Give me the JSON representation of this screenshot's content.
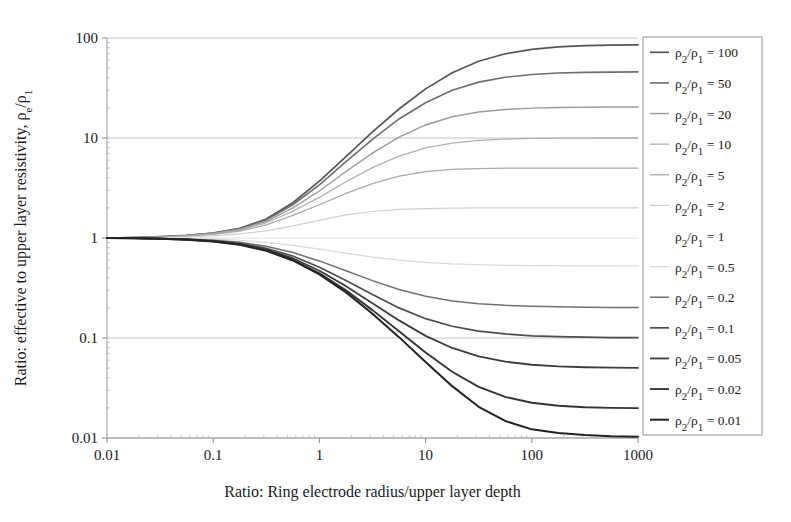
{
  "chart_data": {
    "type": "line",
    "title": "",
    "xlabel": "Ratio: Ring electrode radius/upper layer depth",
    "ylabel": "Ratio: effective to upper layer resistivity, ρe/ρ1",
    "xscale": "log",
    "yscale": "log",
    "xlim": [
      0.01,
      1000
    ],
    "ylim": [
      0.01,
      100
    ],
    "xticks": [
      "0.01",
      "0.1",
      "1",
      "10",
      "100",
      "1000"
    ],
    "xtick_values": [
      0.01,
      0.1,
      1,
      10,
      100,
      1000
    ],
    "yticks": [
      "0.01",
      "0.1",
      "1",
      "10",
      "100"
    ],
    "ytick_values": [
      0.01,
      0.1,
      1,
      10,
      100
    ],
    "grid": true,
    "grid_axis": "y",
    "legend_position": "right-outside",
    "legend_title": "",
    "x": [
      0.01,
      0.0178,
      0.0316,
      0.0562,
      0.1,
      0.178,
      0.316,
      0.562,
      1.0,
      1.78,
      3.16,
      5.62,
      10.0,
      17.8,
      31.6,
      56.2,
      100.0,
      178.0,
      316.0,
      562.0,
      1000.0
    ],
    "series": [
      {
        "name": "ρ2/ρ1 = 100",
        "k": 100,
        "color": "#565656",
        "width": 1.7,
        "values": [
          1.0,
          1.01,
          1.03,
          1.06,
          1.12,
          1.25,
          1.55,
          2.25,
          3.7,
          6.5,
          11.5,
          19.5,
          31.0,
          45.0,
          58.5,
          69.5,
          77.0,
          81.5,
          83.8,
          84.8,
          85.2
        ]
      },
      {
        "name": "ρ2/ρ1 = 50",
        "k": 50,
        "color": "#6e6e6e",
        "width": 1.6,
        "values": [
          1.0,
          1.01,
          1.03,
          1.06,
          1.12,
          1.24,
          1.52,
          2.15,
          3.4,
          5.8,
          9.7,
          15.5,
          22.5,
          30.0,
          36.2,
          40.5,
          43.2,
          44.6,
          45.3,
          45.6,
          45.8
        ]
      },
      {
        "name": "ρ2/ρ1 = 20",
        "k": 20,
        "color": "#9a9a9a",
        "width": 1.4,
        "values": [
          1.0,
          1.01,
          1.02,
          1.05,
          1.11,
          1.22,
          1.47,
          2.0,
          2.95,
          4.62,
          7.05,
          10.2,
          13.5,
          16.3,
          18.2,
          19.3,
          19.9,
          20.2,
          20.3,
          20.4,
          20.4
        ]
      },
      {
        "name": "ρ2/ρ1 = 10",
        "k": 10,
        "color": "#b0b0b0",
        "width": 1.3,
        "values": [
          1.0,
          1.01,
          1.02,
          1.05,
          1.1,
          1.2,
          1.42,
          1.85,
          2.55,
          3.65,
          5.05,
          6.6,
          7.95,
          8.9,
          9.45,
          9.75,
          9.9,
          9.96,
          9.98,
          10.0,
          10.0
        ]
      },
      {
        "name": "ρ2/ρ1 = 5",
        "k": 5,
        "color": "#a8a8a8",
        "width": 1.3,
        "values": [
          1.0,
          1.0,
          1.02,
          1.04,
          1.09,
          1.17,
          1.35,
          1.68,
          2.15,
          2.8,
          3.5,
          4.15,
          4.6,
          4.85,
          4.95,
          4.99,
          5.0,
          5.0,
          5.0,
          5.0,
          5.0
        ]
      },
      {
        "name": "ρ2/ρ1 = 2",
        "k": 2,
        "color": "#cfcfcf",
        "width": 1.2,
        "values": [
          1.0,
          1.0,
          1.01,
          1.02,
          1.05,
          1.1,
          1.18,
          1.32,
          1.5,
          1.7,
          1.84,
          1.93,
          1.97,
          1.99,
          2.0,
          2.0,
          2.0,
          2.0,
          2.0,
          2.0,
          2.0
        ]
      },
      {
        "name": "ρ2/ρ1 = 1",
        "k": 1,
        "color": "#ffffff",
        "width": 1.0,
        "values": [
          1.0,
          1.0,
          1.0,
          1.0,
          1.0,
          1.0,
          1.0,
          1.0,
          1.0,
          1.0,
          1.0,
          1.0,
          1.0,
          1.0,
          1.0,
          1.0,
          1.0,
          1.0,
          1.0,
          1.0,
          1.0
        ]
      },
      {
        "name": "ρ2/ρ1 = 0.5",
        "k": 0.5,
        "color": "#d8d8d8",
        "width": 1.2,
        "values": [
          1.0,
          1.0,
          0.995,
          0.99,
          0.975,
          0.95,
          0.905,
          0.845,
          0.775,
          0.705,
          0.645,
          0.6,
          0.57,
          0.55,
          0.54,
          0.533,
          0.53,
          0.528,
          0.527,
          0.526,
          0.525
        ]
      },
      {
        "name": "ρ2/ρ1 = 0.2",
        "k": 0.2,
        "color": "#707070",
        "width": 1.5,
        "values": [
          1.0,
          0.998,
          0.99,
          0.978,
          0.95,
          0.905,
          0.825,
          0.715,
          0.59,
          0.47,
          0.375,
          0.305,
          0.262,
          0.235,
          0.22,
          0.212,
          0.208,
          0.205,
          0.203,
          0.202,
          0.202
        ]
      },
      {
        "name": "ρ2/ρ1 = 0.1",
        "k": 0.1,
        "color": "#4d4d4d",
        "width": 1.7,
        "values": [
          1.0,
          0.997,
          0.988,
          0.972,
          0.94,
          0.885,
          0.79,
          0.66,
          0.51,
          0.375,
          0.272,
          0.2,
          0.156,
          0.131,
          0.117,
          0.11,
          0.105,
          0.103,
          0.102,
          0.101,
          0.101
        ]
      },
      {
        "name": "ρ2/ρ1 = 0.05",
        "k": 0.05,
        "color": "#3d3d3d",
        "width": 1.8,
        "values": [
          1.0,
          0.996,
          0.986,
          0.968,
          0.932,
          0.872,
          0.768,
          0.628,
          0.47,
          0.33,
          0.222,
          0.15,
          0.105,
          0.0795,
          0.0655,
          0.058,
          0.054,
          0.052,
          0.051,
          0.0505,
          0.0502
        ]
      },
      {
        "name": "ρ2/ρ1 = 0.02",
        "k": 0.02,
        "color": "#333333",
        "width": 1.9,
        "values": [
          1.0,
          0.995,
          0.984,
          0.965,
          0.926,
          0.862,
          0.752,
          0.606,
          0.444,
          0.3,
          0.19,
          0.117,
          0.0715,
          0.046,
          0.0325,
          0.0258,
          0.0225,
          0.021,
          0.0203,
          0.02,
          0.0199
        ]
      },
      {
        "name": "ρ2/ρ1 = 0.01",
        "k": 0.01,
        "color": "#222222",
        "width": 2.0,
        "values": [
          1.0,
          0.995,
          0.983,
          0.963,
          0.923,
          0.857,
          0.745,
          0.596,
          0.432,
          0.286,
          0.175,
          0.102,
          0.0575,
          0.033,
          0.0205,
          0.0148,
          0.0122,
          0.0112,
          0.0107,
          0.0104,
          0.0103
        ]
      }
    ]
  },
  "axes": {
    "y_title_parts": {
      "main": "Ratio: effective to upper layer resistivity, ",
      "rho": "ρ",
      "sub_e": "e",
      "slash": "/",
      "rho2": "ρ",
      "sub_1": "1"
    },
    "x_title": "Ratio: Ring electrode radius/upper layer depth"
  },
  "legend": {
    "entries": [
      {
        "label": "ρ2/ρ1 = 100",
        "prefix": "ρ",
        "sub_a": "2",
        "mid": "/",
        "rho_b": "ρ",
        "sub_b": "1",
        "eq": " = ",
        "value": "100"
      },
      {
        "label": "ρ2/ρ1 = 50",
        "prefix": "ρ",
        "sub_a": "2",
        "mid": "/",
        "rho_b": "ρ",
        "sub_b": "1",
        "eq": " = ",
        "value": "50"
      },
      {
        "label": "ρ2/ρ1 = 20",
        "prefix": "ρ",
        "sub_a": "2",
        "mid": "/",
        "rho_b": "ρ",
        "sub_b": "1",
        "eq": " = ",
        "value": "20"
      },
      {
        "label": "ρ2/ρ1 = 10",
        "prefix": "ρ",
        "sub_a": "2",
        "mid": "/",
        "rho_b": "ρ",
        "sub_b": "1",
        "eq": " = ",
        "value": "10"
      },
      {
        "label": "ρ2/ρ1 = 5",
        "prefix": "ρ",
        "sub_a": "2",
        "mid": "/",
        "rho_b": "ρ",
        "sub_b": "1",
        "eq": " = ",
        "value": "5"
      },
      {
        "label": "ρ2/ρ1 = 2",
        "prefix": "ρ",
        "sub_a": "2",
        "mid": "/",
        "rho_b": "ρ",
        "sub_b": "1",
        "eq": " = ",
        "value": "2"
      },
      {
        "label": "ρ2/ρ1 = 1",
        "prefix": "ρ",
        "sub_a": "2",
        "mid": "/",
        "rho_b": "ρ",
        "sub_b": "1",
        "eq": " = ",
        "value": "1"
      },
      {
        "label": "ρ2/ρ1 = 0.5",
        "prefix": "ρ",
        "sub_a": "2",
        "mid": "/",
        "rho_b": "ρ",
        "sub_b": "1",
        "eq": " = ",
        "value": "0.5"
      },
      {
        "label": "ρ2/ρ1 = 0.2",
        "prefix": "ρ",
        "sub_a": "2",
        "mid": "/",
        "rho_b": "ρ",
        "sub_b": "1",
        "eq": " = ",
        "value": "0.2"
      },
      {
        "label": "ρ2/ρ1 = 0.1",
        "prefix": "ρ",
        "sub_a": "2",
        "mid": "/",
        "rho_b": "ρ",
        "sub_b": "1",
        "eq": " = ",
        "value": "0.1"
      },
      {
        "label": "ρ2/ρ1 = 0.05",
        "prefix": "ρ",
        "sub_a": "2",
        "mid": "/",
        "rho_b": "ρ",
        "sub_b": "1",
        "eq": " = ",
        "value": "0.05"
      },
      {
        "label": "ρ2/ρ1 = 0.02",
        "prefix": "ρ",
        "sub_a": "2",
        "mid": "/",
        "rho_b": "ρ",
        "sub_b": "1",
        "eq": " = ",
        "value": "0.02"
      },
      {
        "label": "ρ2/ρ1 = 0.01",
        "prefix": "ρ",
        "sub_a": "2",
        "mid": "/",
        "rho_b": "ρ",
        "sub_b": "1",
        "eq": " = ",
        "value": "0.01"
      }
    ]
  },
  "colors": {
    "background": "#ffffff",
    "axis": "#9a9a9a",
    "grid": "#b5b5b5",
    "text": "#1a1a1a",
    "legend_border": "#8f8f8f"
  }
}
